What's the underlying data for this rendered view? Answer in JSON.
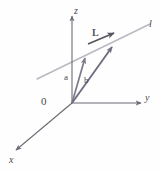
{
  "figure": {
    "type": "vector-diagram",
    "background_color": "#fefefe"
  },
  "axes": {
    "origin_label": "0",
    "x_label": "x",
    "y_label": "y",
    "z_label": "z",
    "color": "#6b6b73",
    "x": {
      "from": [
        72,
        103
      ],
      "to": [
        14,
        152
      ],
      "arrow": true
    },
    "y": {
      "from": [
        72,
        103
      ],
      "to": [
        143,
        103
      ],
      "arrow": true
    },
    "z": {
      "from": [
        72,
        103
      ],
      "to": [
        72,
        14
      ],
      "arrow": true
    }
  },
  "line": {
    "label": "l",
    "color": "#b9b9c4",
    "from": [
      37,
      79
    ],
    "to": [
      150,
      24
    ]
  },
  "vectors": [
    {
      "name": "a",
      "label": "a",
      "color": "#7b7b8c",
      "from": [
        72,
        103
      ],
      "to": [
        86,
        56
      ]
    },
    {
      "name": "b",
      "label": "b",
      "color": "#6e6e80",
      "from": [
        72,
        103
      ],
      "to": [
        114,
        45
      ]
    },
    {
      "name": "L",
      "label": "L",
      "color": "#55555e",
      "from": [
        88,
        44
      ],
      "to": [
        117,
        32
      ]
    }
  ],
  "colors": {
    "axis": "#6b6b73",
    "line": "#b9b9c4",
    "vector_a": "#7b7b8c",
    "vector_b": "#6e6e80",
    "vector_L": "#55555e",
    "text": "#4a4a52"
  }
}
